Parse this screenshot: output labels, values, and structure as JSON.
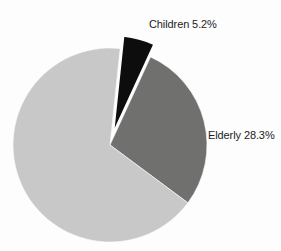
{
  "chart_data": {
    "type": "pie",
    "title": "",
    "subtitle": "",
    "xlabel": "",
    "ylabel": "",
    "legend_position": "none",
    "grid": false,
    "units": "percent",
    "center": {
      "x": 110,
      "y": 145
    },
    "radius": 97,
    "start_angle_deg": -84,
    "labels_shown": [
      "Children 5.2%",
      "Elderly 28.3%"
    ],
    "categories": [
      "Children",
      "Elderly",
      "Other"
    ],
    "values": [
      5.2,
      28.3,
      66.5
    ],
    "colors": [
      "#0d0d0d",
      "#70706f",
      "#c8c8c8"
    ],
    "slices": [
      {
        "name": "Children",
        "value": 5.2,
        "label": "Children 5.2%",
        "color": "#0d0d0d",
        "exploded": true,
        "explode_offset": 13,
        "label_visible": true
      },
      {
        "name": "Elderly",
        "value": 28.3,
        "label": "Elderly 28.3%",
        "color": "#70706f",
        "exploded": false,
        "explode_offset": 0,
        "label_visible": true
      },
      {
        "name": "Other",
        "value": 66.5,
        "label": "",
        "color": "#c8c8c8",
        "exploded": false,
        "explode_offset": 0,
        "label_visible": false
      }
    ]
  },
  "labels": {
    "children": "Children 5.2%",
    "elderly": "Elderly 28.3%"
  },
  "style": {
    "background": "#fdfdfd",
    "text_color": "#1c1c1c",
    "gap_color": "#fdfdfd"
  }
}
